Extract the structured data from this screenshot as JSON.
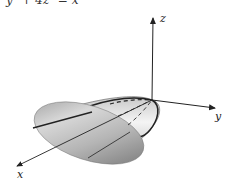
{
  "figure": {
    "equation": "y² + 4z² = x",
    "surface": "elliptic paraboloid",
    "axes": {
      "x_label": "x",
      "y_label": "y",
      "z_label": "z"
    },
    "colors": {
      "axis": "#222222",
      "surface_dark": "#8a8a8a",
      "surface_light": "#f0f0f0",
      "trace_line": "#1a1a1a"
    }
  }
}
